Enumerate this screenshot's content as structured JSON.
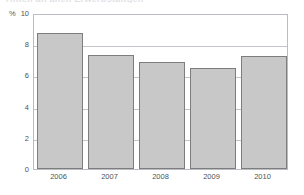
{
  "figure": {
    "title_sliver": "Anteil an allen Erwerbstätigen",
    "unit_label": "%"
  },
  "chart_data": {
    "type": "bar",
    "title": "",
    "xlabel": "",
    "ylabel": "%",
    "categories": [
      "2006",
      "2007",
      "2008",
      "2009",
      "2010"
    ],
    "values": [
      8.7,
      7.3,
      6.85,
      6.45,
      7.25
    ],
    "ylim": [
      0,
      10
    ],
    "yticks": [
      0,
      2,
      4,
      6,
      8,
      10
    ],
    "ytick_labels": [
      "0",
      "2",
      "4",
      "6",
      "8",
      "10"
    ],
    "gridlines": [
      2,
      4,
      6,
      8
    ],
    "grid": true,
    "legend": null,
    "bar_fill_color": "#c8c8c8",
    "bar_border_color": "#7d7d7d",
    "gridline_color": "#c2c5c9",
    "axis_color": "#b9bcc0",
    "text_color": "#4e5357",
    "background_color": "#ffffff"
  }
}
